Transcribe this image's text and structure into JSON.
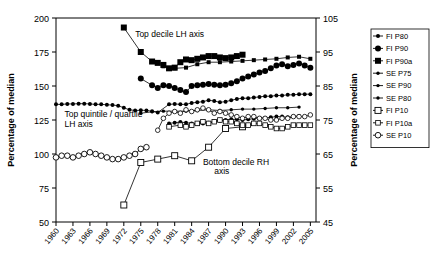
{
  "chart_data": {
    "type": "line",
    "title": "",
    "xlabel": "",
    "ylabel": "Percentage of median",
    "ylabel_right": "Percentage of median",
    "xlim": [
      1960,
      2006
    ],
    "ylim": [
      50,
      200
    ],
    "ylim_right": [
      45,
      105
    ],
    "grid": false,
    "legend_position": "right",
    "x_ticks": [
      1960,
      1963,
      1966,
      1969,
      1972,
      1975,
      1978,
      1981,
      1984,
      1987,
      1990,
      1993,
      1996,
      1999,
      2002,
      2005
    ],
    "y_ticks_left": [
      50,
      75,
      100,
      125,
      150,
      175,
      200
    ],
    "y_ticks_right": [
      45,
      55,
      65,
      75,
      85,
      95,
      105
    ],
    "annotations": [
      {
        "text": "Top decile LH axis",
        "x": 1974,
        "y": 186
      },
      {
        "text": "Top quintile / quartile",
        "x": 1961.5,
        "y": 127
      },
      {
        "text": "LH axis",
        "x": 1961.5,
        "y": 120
      },
      {
        "text": "Bottom decile RH",
        "x": 1986,
        "y": 92
      },
      {
        "text": "axis",
        "x": 1988,
        "y": 85
      }
    ],
    "series": [
      {
        "name": "FI P80",
        "marker": "filled-circle-small",
        "axis": "left",
        "points": [
          [
            1960,
            136.5
          ],
          [
            1961,
            136.5
          ],
          [
            1962,
            136.8
          ],
          [
            1963,
            136.8
          ],
          [
            1964,
            137.0
          ],
          [
            1965,
            137.0
          ],
          [
            1966,
            136.8
          ],
          [
            1967,
            136.5
          ],
          [
            1968,
            136.5
          ],
          [
            1969,
            136.2
          ],
          [
            1970,
            136.0
          ],
          [
            1971,
            135.5
          ],
          [
            1972,
            134.0
          ],
          [
            1973,
            132.5
          ],
          [
            1974,
            132.0
          ],
          [
            1975,
            132.2
          ],
          [
            1976,
            132.0
          ],
          [
            1977,
            131.5
          ],
          [
            1978,
            130.5
          ],
          [
            1980,
            136.5
          ],
          [
            1981,
            136.8
          ],
          [
            1982,
            136.5
          ],
          [
            1983,
            136.5
          ],
          [
            1984,
            137.5
          ],
          [
            1985,
            138.0
          ],
          [
            1986,
            138.5
          ],
          [
            1987,
            139.5
          ],
          [
            1988,
            139.0
          ],
          [
            1989,
            138.0
          ],
          [
            1990,
            138.5
          ],
          [
            1991,
            139.5
          ],
          [
            1992,
            140.5
          ],
          [
            1993,
            141.0
          ],
          [
            1994,
            141.0
          ],
          [
            1995,
            141.5
          ],
          [
            1996,
            142.0
          ],
          [
            1997,
            142.5
          ],
          [
            1998,
            142.5
          ],
          [
            1999,
            143.0
          ],
          [
            2000,
            143.0
          ],
          [
            2001,
            143.5
          ],
          [
            2002,
            143.5
          ],
          [
            2003,
            144.0
          ],
          [
            2004,
            144.0
          ],
          [
            2005,
            144.0
          ]
        ]
      },
      {
        "name": "FI P90",
        "marker": "filled-circle",
        "axis": "left",
        "points": [
          [
            1975,
            155.5
          ],
          [
            1977,
            150.5
          ],
          [
            1978,
            148.5
          ],
          [
            1979,
            150.5
          ],
          [
            1980,
            150.0
          ],
          [
            1981,
            148.5
          ],
          [
            1982,
            147.0
          ],
          [
            1983,
            145.5
          ],
          [
            1984,
            150.0
          ],
          [
            1985,
            150.5
          ],
          [
            1986,
            151.0
          ],
          [
            1987,
            151.5
          ],
          [
            1988,
            151.0
          ],
          [
            1989,
            150.5
          ],
          [
            1990,
            151.0
          ],
          [
            1991,
            152.0
          ],
          [
            1992,
            153.5
          ],
          [
            1993,
            155.5
          ],
          [
            1994,
            157.0
          ],
          [
            1995,
            158.5
          ],
          [
            1996,
            160.0
          ],
          [
            1997,
            161.0
          ],
          [
            1998,
            163.0
          ],
          [
            1999,
            165.0
          ],
          [
            2000,
            166.0
          ],
          [
            2001,
            164.5
          ],
          [
            2002,
            165.5
          ],
          [
            2003,
            166.5
          ],
          [
            2004,
            165.0
          ],
          [
            2005,
            163.5
          ]
        ]
      },
      {
        "name": "FI P90a",
        "marker": "filled-square",
        "axis": "left",
        "points": [
          [
            1972,
            193.0
          ],
          [
            1975,
            175.0
          ],
          [
            1977,
            168.0
          ],
          [
            1978,
            167.0
          ],
          [
            1979,
            165.5
          ],
          [
            1980,
            163.0
          ],
          [
            1981,
            163.5
          ],
          [
            1982,
            167.5
          ],
          [
            1983,
            169.5
          ],
          [
            1984,
            169.0
          ],
          [
            1985,
            170.0
          ],
          [
            1986,
            171.0
          ],
          [
            1987,
            172.0
          ],
          [
            1988,
            172.0
          ],
          [
            1989,
            171.0
          ],
          [
            1990,
            170.5
          ],
          [
            1991,
            171.0
          ],
          [
            1992,
            172.0
          ],
          [
            1993,
            173.0
          ]
        ]
      },
      {
        "name": "SE P75",
        "marker": "filled-circle-small",
        "axis": "left",
        "points": [
          [
            1980,
            122.5
          ],
          [
            1981,
            123.0
          ],
          [
            1982,
            123.5
          ],
          [
            1983,
            123.0
          ],
          [
            1984,
            122.5
          ],
          [
            1985,
            122.0
          ],
          [
            1986,
            122.5
          ],
          [
            1987,
            123.0
          ],
          [
            1988,
            124.0
          ],
          [
            1989,
            124.5
          ],
          [
            1990,
            125.0
          ],
          [
            1991,
            125.5
          ],
          [
            1992,
            125.5
          ],
          [
            1993,
            125.0
          ],
          [
            1994,
            125.5
          ],
          [
            1995,
            126.0
          ],
          [
            1996,
            126.5
          ],
          [
            1997,
            126.5
          ],
          [
            1998,
            127.0
          ],
          [
            1999,
            127.5
          ],
          [
            2000,
            127.5
          ],
          [
            2001,
            127.0
          ],
          [
            2002,
            127.5
          ],
          [
            2003,
            128.0
          ]
        ]
      },
      {
        "name": "SE P90",
        "marker": "filled-square-small",
        "axis": "left",
        "points": [
          [
            1979,
            164.5
          ],
          [
            1981,
            163.0
          ],
          [
            1983,
            163.5
          ],
          [
            1985,
            166.0
          ],
          [
            1987,
            167.5
          ],
          [
            1989,
            167.5
          ],
          [
            1991,
            168.0
          ],
          [
            1993,
            168.5
          ],
          [
            1995,
            169.0
          ],
          [
            1997,
            169.5
          ],
          [
            1999,
            170.0
          ],
          [
            2001,
            171.0
          ],
          [
            2003,
            171.5
          ],
          [
            2005,
            170.0
          ]
        ]
      },
      {
        "name": "SE P80",
        "marker": "filled-circle-tiny",
        "axis": "left",
        "points": [
          [
            1975,
            130.0
          ],
          [
            1977,
            131.0
          ],
          [
            1979,
            131.5
          ],
          [
            1981,
            131.5
          ],
          [
            1983,
            131.5
          ],
          [
            1985,
            132.0
          ],
          [
            1987,
            132.5
          ],
          [
            1989,
            132.0
          ],
          [
            1991,
            132.5
          ],
          [
            1993,
            133.0
          ],
          [
            1995,
            133.0
          ],
          [
            1997,
            133.5
          ],
          [
            1999,
            134.0
          ],
          [
            2001,
            134.0
          ],
          [
            2003,
            134.5
          ]
        ]
      },
      {
        "name": "FI P10",
        "marker": "open-square",
        "axis": "right",
        "points": [
          [
            1972,
            50.0
          ],
          [
            1975,
            62.5
          ],
          [
            1978,
            63.5
          ],
          [
            1981,
            64.5
          ],
          [
            1984,
            63.0
          ],
          [
            1987,
            67.0
          ],
          [
            1990,
            72.5
          ],
          [
            1993,
            73.0
          ]
        ]
      },
      {
        "name": "FI P10a",
        "marker": "open-square-small",
        "axis": "right",
        "points": [
          [
            1980,
            73.0
          ],
          [
            1982,
            73.5
          ],
          [
            1983,
            73.0
          ],
          [
            1984,
            73.5
          ],
          [
            1985,
            74.0
          ],
          [
            1986,
            74.5
          ],
          [
            1987,
            74.0
          ],
          [
            1988,
            74.5
          ],
          [
            1989,
            75.0
          ],
          [
            1990,
            74.5
          ],
          [
            1991,
            74.5
          ],
          [
            1992,
            74.0
          ],
          [
            1993,
            73.5
          ],
          [
            1994,
            73.5
          ],
          [
            1995,
            74.0
          ],
          [
            1996,
            74.0
          ],
          [
            1997,
            73.5
          ],
          [
            1998,
            73.0
          ],
          [
            1999,
            72.5
          ],
          [
            2000,
            72.5
          ],
          [
            2001,
            73.0
          ],
          [
            2002,
            73.5
          ],
          [
            2003,
            73.5
          ],
          [
            2004,
            73.5
          ],
          [
            2005,
            73.5
          ]
        ]
      },
      {
        "name": "SE P10",
        "marker": "open-circle",
        "axis": "right",
        "points": [
          [
            1960,
            64.0
          ],
          [
            1961,
            64.5
          ],
          [
            1962,
            64.5
          ],
          [
            1963,
            64.0
          ],
          [
            1964,
            64.5
          ],
          [
            1965,
            65.0
          ],
          [
            1966,
            65.5
          ],
          [
            1967,
            65.0
          ],
          [
            1968,
            64.5
          ],
          [
            1969,
            64.0
          ],
          [
            1970,
            63.5
          ],
          [
            1971,
            63.5
          ],
          [
            1972,
            64.0
          ],
          [
            1973,
            64.5
          ],
          [
            1974,
            65.0
          ],
          [
            1975,
            66.5
          ],
          [
            1976,
            67.0
          ]
        ]
      },
      {
        "name": "SE P10a",
        "marker": "open-circle-small",
        "axis": "right",
        "points": [
          [
            1978,
            72.0
          ],
          [
            1979,
            75.5
          ],
          [
            1980,
            77.0
          ],
          [
            1981,
            77.5
          ],
          [
            1982,
            77.0
          ],
          [
            1983,
            78.0
          ],
          [
            1984,
            77.5
          ],
          [
            1985,
            78.0
          ],
          [
            1986,
            78.5
          ],
          [
            1987,
            78.0
          ],
          [
            1988,
            77.0
          ],
          [
            1989,
            77.5
          ],
          [
            1990,
            77.0
          ],
          [
            1991,
            76.5
          ],
          [
            1992,
            76.0
          ],
          [
            1993,
            75.5
          ],
          [
            1994,
            76.0
          ],
          [
            1995,
            76.0
          ],
          [
            1996,
            75.5
          ],
          [
            1997,
            75.5
          ],
          [
            1998,
            75.0
          ],
          [
            1999,
            75.0
          ],
          [
            2000,
            75.5
          ],
          [
            2001,
            75.5
          ],
          [
            2002,
            76.0
          ],
          [
            2003,
            76.0
          ],
          [
            2004,
            76.0
          ],
          [
            2005,
            76.5
          ]
        ]
      }
    ]
  },
  "legend": {
    "items": [
      {
        "label": "FI P80",
        "marker": "filled-circle-small"
      },
      {
        "label": "FI P90",
        "marker": "filled-circle"
      },
      {
        "label": "FI P90a",
        "marker": "filled-square"
      },
      {
        "label": "SE P75",
        "marker": "filled-circle-tiny"
      },
      {
        "label": "SE P90",
        "marker": "filled-circle-tiny"
      },
      {
        "label": "SE P80",
        "marker": "filled-circle-tiny"
      },
      {
        "label": "FI P10",
        "marker": "open-square"
      },
      {
        "label": "FI P10a",
        "marker": "open-square-small"
      },
      {
        "label": "SE P10",
        "marker": "open-circle"
      }
    ]
  },
  "colors": {
    "axis": "#000000",
    "series": "#000000",
    "background": "#ffffff"
  }
}
